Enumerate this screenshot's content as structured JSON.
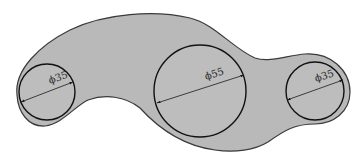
{
  "drawing": {
    "type": "mechanical part outline",
    "fill_color": "#b9b9b9",
    "outline_color": "#3a3a3a",
    "holes": [
      {
        "id": "left-hole",
        "label": "ϕ35",
        "diameter": 35
      },
      {
        "id": "middle-hole",
        "label": "ϕ55",
        "diameter": 55
      },
      {
        "id": "right-hole",
        "label": "ϕ35",
        "diameter": 35
      }
    ]
  }
}
